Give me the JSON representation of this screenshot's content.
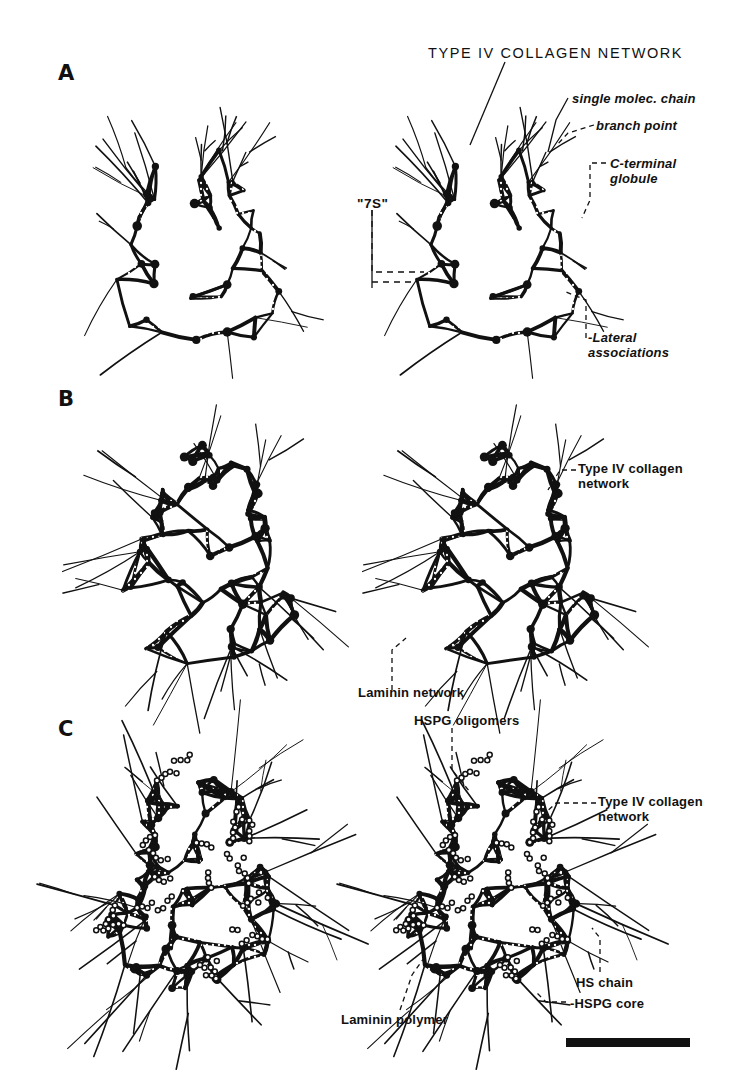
{
  "figure": {
    "title": "TYPE IV COLLAGEN NETWORK",
    "background_color": "#ffffff",
    "ink_color": "#111111",
    "width": 735,
    "height": 1089
  },
  "panels": [
    {
      "letter": "A",
      "x": 58,
      "y": 62,
      "description": "type IV collagen network alone, duplicate stereo pair"
    },
    {
      "letter": "B",
      "x": 58,
      "y": 388,
      "description": "type IV collagen network with laminin network"
    },
    {
      "letter": "C",
      "x": 58,
      "y": 718,
      "description": "collagen, laminin polymer and HSPG oligomers"
    }
  ],
  "annotations": [
    {
      "id": "single-molec-chain",
      "text": "single molec. chain",
      "x": 572,
      "y": 92,
      "style": "italic"
    },
    {
      "id": "branch-point",
      "text": "branch point",
      "x": 596,
      "y": 119,
      "style": "italic"
    },
    {
      "id": "c-terminal-globule",
      "text": "C-terminal\nglobule",
      "x": 610,
      "y": 157,
      "style": "italic"
    },
    {
      "id": "seven-s",
      "text": "\"7S\"",
      "x": 357,
      "y": 196,
      "style": "bold"
    },
    {
      "id": "lateral-associations",
      "text": "-Lateral\nassociations",
      "x": 588,
      "y": 331,
      "style": "italic"
    },
    {
      "id": "type-iv-collagen-network-b",
      "text": "Type IV collagen\nnetwork",
      "x": 578,
      "y": 462,
      "style": "italic"
    },
    {
      "id": "laminin-network",
      "text": "Laminin network",
      "x": 358,
      "y": 686,
      "style": "italic"
    },
    {
      "id": "hspg-oligomers",
      "text": "HSPG oligomers",
      "x": 414,
      "y": 714,
      "style": "italic"
    },
    {
      "id": "type-iv-collagen-network-c",
      "text": "Type IV collagen\nnetwork",
      "x": 598,
      "y": 795,
      "style": "italic"
    },
    {
      "id": "hs-chain",
      "text": "HS chain",
      "x": 576,
      "y": 976,
      "style": "italic"
    },
    {
      "id": "hspg-core",
      "text": "-HSPG core",
      "x": 570,
      "y": 997,
      "style": "italic"
    },
    {
      "id": "laminin-polymer",
      "text": "Laminin polymer",
      "x": 341,
      "y": 1013,
      "style": "italic"
    }
  ],
  "scale_bar": {
    "x": 566,
    "y": 1038,
    "width": 124,
    "height": 9,
    "label": ""
  },
  "icons": {
    "leader_line": "dashed-leader-line",
    "scale_bar": "scale-bar"
  }
}
